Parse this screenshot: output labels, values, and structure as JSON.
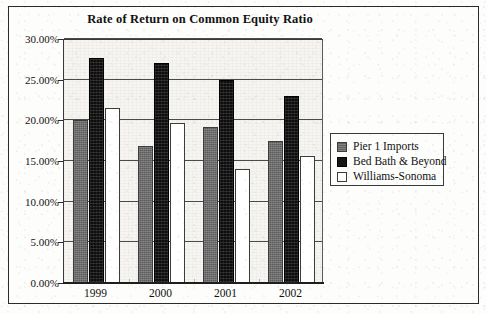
{
  "figure": {
    "title": "Rate of Return on Common Equity Ratio"
  },
  "legend": {
    "position": "right",
    "entries": [
      {
        "label": "Pier 1 Imports",
        "swatch": "gray"
      },
      {
        "label": "Bed Bath & Beyond",
        "swatch": "black"
      },
      {
        "label": "Williams-Sonoma",
        "swatch": "white"
      }
    ]
  },
  "axis": {
    "y_ticks": [
      "0.00%",
      "5.00%",
      "10.00%",
      "15.00%",
      "20.00%",
      "25.00%",
      "30.00%"
    ],
    "x_ticks": [
      "1999",
      "2000",
      "2001",
      "2002"
    ]
  },
  "colors": {
    "series_pier1": "#6e6e6e",
    "series_bedbath": "#151515",
    "series_williams": "#ffffff",
    "frame": "#2b2b2b",
    "gridline": "#4a4a4a",
    "plot_background": "#f6f5f2"
  },
  "chart_data": {
    "type": "bar",
    "title": "Rate of Return on Common Equity Ratio",
    "xlabel": "",
    "ylabel": "",
    "categories": [
      "1999",
      "2000",
      "2001",
      "2002"
    ],
    "series": [
      {
        "name": "Pier 1 Imports",
        "values": [
          20.1,
          16.9,
          19.2,
          17.4
        ]
      },
      {
        "name": "Bed Bath & Beyond",
        "values": [
          27.7,
          27.1,
          25.0,
          23.0
        ]
      },
      {
        "name": "Williams-Sonoma",
        "values": [
          21.5,
          19.7,
          14.0,
          15.6
        ]
      }
    ],
    "ylim": [
      0,
      30
    ],
    "ytick_values": [
      0,
      5,
      10,
      15,
      20,
      25,
      30
    ],
    "ytick_format": "percent",
    "grid": true,
    "legend_position": "right"
  }
}
